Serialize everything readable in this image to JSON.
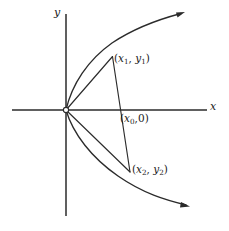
{
  "figure": {
    "background_color": "#ffffff",
    "ink_color": "#2b2b2b",
    "width": 229,
    "height": 231,
    "axes": {
      "y_axis_label": "y",
      "x_axis_label": "x",
      "origin": {
        "x": 66,
        "y": 110
      },
      "x_axis_extent": {
        "x1": 12,
        "x2": 207
      },
      "y_axis_extent": {
        "y1": 14,
        "y2": 216
      }
    },
    "labels": {
      "point1": {
        "open": "(",
        "var_x": "x",
        "sub_x": "1",
        "comma": ", ",
        "var_y": "y",
        "sub_y": "1",
        "close": ")",
        "text": "(x1, y1)"
      },
      "point0": {
        "open": "(",
        "var_x": "x",
        "sub_x": "0",
        "comma": ",",
        "zero": "0",
        "close": ")",
        "text": "(x0,0)"
      },
      "point2": {
        "open": "(",
        "var_x": "x",
        "sub_x": "2",
        "comma": ", ",
        "var_y": "y",
        "sub_y": "2",
        "close": ")",
        "text": "(x2, y2)"
      }
    },
    "points": {
      "origin_marker": {
        "x": 66,
        "y": 110,
        "r": 2.6,
        "style": "open-circle"
      },
      "p1": {
        "x": 112,
        "y": 57
      },
      "p0": {
        "x": 122,
        "y": 110
      },
      "p2": {
        "x": 130,
        "y": 172
      }
    },
    "curves": {
      "parabola_upper": "M 66 110 C 72 84 88 60 112 43 C 136 27 160 19 182 13",
      "parabola_lower": "M 66 110 C 73 134 92 158 118 176 C 144 194 166 200 186 205",
      "chord_upper": "M 66 110 L 112 57",
      "chord_lower": "M 66 110 L 130 172",
      "secant": "M 112 57 L 130 172"
    },
    "arrows": [
      {
        "name": "upper-branch-arrow",
        "tip_x": 184,
        "tip_y": 13,
        "angle_deg": -17
      },
      {
        "name": "lower-branch-arrow",
        "tip_x": 189,
        "tip_y": 206,
        "angle_deg": 16
      }
    ]
  }
}
